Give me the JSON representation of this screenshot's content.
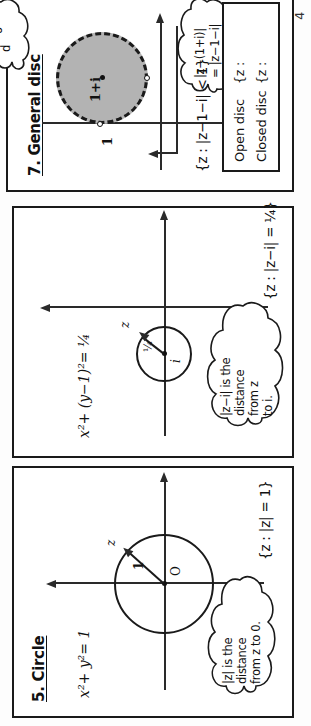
{
  "page": {
    "page_number": "4",
    "orientation": "rotated-90-ccw",
    "background_color": "#fdfdfd",
    "ink_color": "#1a1a1a"
  },
  "panels": [
    {
      "id": "circle",
      "title": "5. Circle",
      "cartesian_equation": "x²+ y²= 1",
      "origin_label": "O",
      "radius_label": "1",
      "point_label": "z",
      "cloud_note": "|z| is the\ndistance\nfrom z to 0.",
      "cloud_lines": [
        "|z| is the",
        "distance",
        "from z to 0."
      ],
      "set_notation": "{z : |z| = 1}",
      "circle_center": "0",
      "circle_radius": "1",
      "circle_style": "solid"
    },
    {
      "id": "circle-i",
      "title": "",
      "cartesian_equation": "x²+ (y−1)²= ¼",
      "center_label": "i",
      "radius_label": "¼",
      "point_label": "z",
      "cloud_note": "|z−i| is the\ndistance\nfrom z\nto i.",
      "cloud_lines": [
        "|z−i| is the",
        "distance",
        "from z",
        "to i."
      ],
      "set_notation": "{z : |z−i| = ¼}",
      "circle_center": "i",
      "circle_radius": "1/4",
      "circle_style": "solid"
    },
    {
      "id": "general-disc",
      "title": "7. General disc",
      "center_label": "1+i",
      "radius_label": "1",
      "cloud_note": "|z−(1+i)|\n= |z−1−i|",
      "cloud_lines": [
        "|z−(1+i)|",
        "= |z−1−i|"
      ],
      "set_notation": "{z : |z−1−i| < 1}",
      "disc_fill": "#b3b3b3",
      "disc_style": "dashed",
      "top_cloud_lines": [
        "d",
        "o"
      ]
    }
  ],
  "legend": {
    "rows": [
      {
        "label": "Open disc",
        "set": "{z :"
      },
      {
        "label": "Closed disc",
        "set": "{z :"
      }
    ]
  },
  "icons": {
    "axis_arrow": "arrow-icon",
    "center_dot": "point-dot-icon",
    "boundary_dot": "hollow-point-icon"
  }
}
